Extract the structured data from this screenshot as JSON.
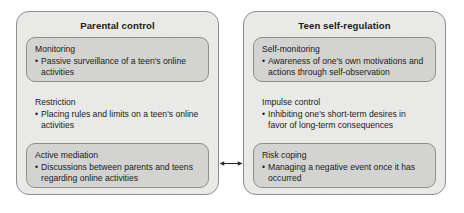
{
  "figure": {
    "type": "two-column concept diagram",
    "background_color": "#ffffff",
    "panel_fill": "#e9e9e7",
    "block_fill": "#d3d3d1",
    "border_color": "#8d8d8d",
    "text_color": "#1b1b1b"
  },
  "panels": [
    {
      "id": "parental-control",
      "title": "Parental control",
      "blocks": [
        {
          "heading": "Monitoring",
          "bullet_marker": "•",
          "bullet": "Passive surveillance of a teen's online activities",
          "boxed": true
        },
        {
          "heading": "Restriction",
          "bullet_marker": "•",
          "bullet": "Placing rules and limits on a teen's online activities",
          "boxed": false
        },
        {
          "heading": "Active mediation",
          "bullet_marker": "•",
          "bullet": "Discussions between parents and teens regarding online activities",
          "boxed": true
        }
      ]
    },
    {
      "id": "teen-self-regulation",
      "title": "Teen self-regulation",
      "blocks": [
        {
          "heading": "Self-monitoring",
          "bullet_marker": "•",
          "bullet": "Awareness of one's own motivations and actions through self-observation",
          "boxed": true
        },
        {
          "heading": "Impulse control",
          "bullet_marker": "•",
          "bullet": "Inhibiting one's short-term desires in favor of long-term consequences",
          "boxed": false
        },
        {
          "heading": "Risk coping",
          "bullet_marker": "•",
          "bullet": "Managing a negative event once it has occurred",
          "boxed": true
        }
      ]
    }
  ],
  "connector": {
    "style": "double-headed-arrow",
    "from": "Active mediation",
    "to": "Risk coping",
    "color": "#2b2b2b",
    "label": ""
  }
}
